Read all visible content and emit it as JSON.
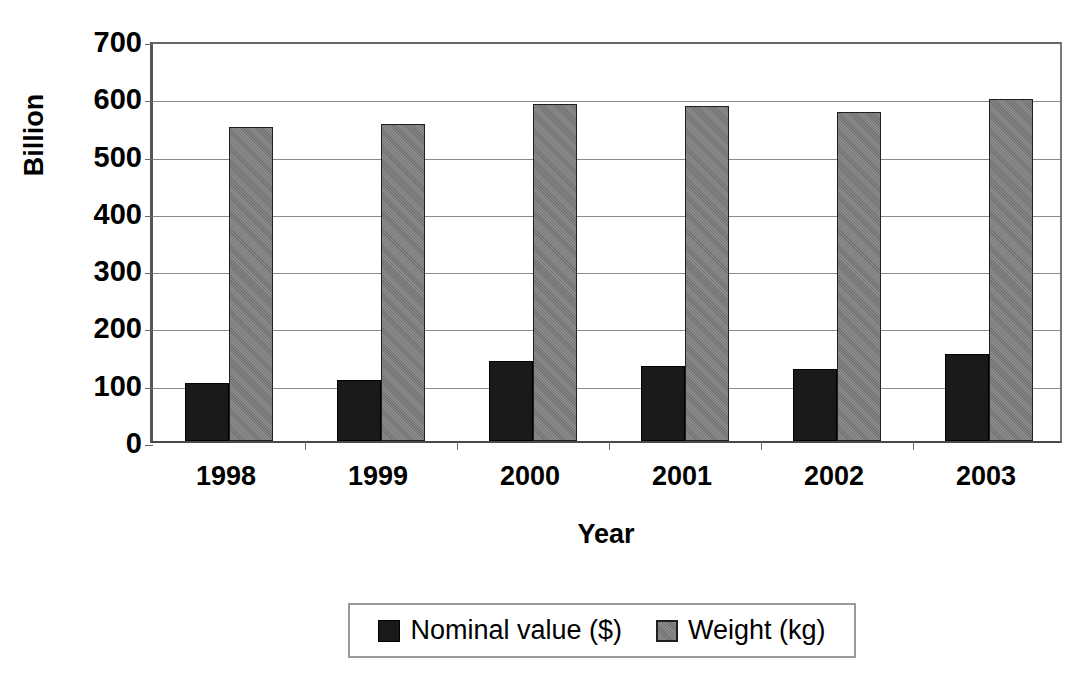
{
  "chart_data": {
    "type": "bar",
    "title": "",
    "subtitle": "",
    "xlabel": "Year",
    "ylabel": "Billion",
    "categories": [
      "1998",
      "1999",
      "2000",
      "2001",
      "2002",
      "2003"
    ],
    "series": [
      {
        "name": "Nominal value ($)",
        "color": "#1a1a1a",
        "values": [
          101,
          106,
          140,
          131,
          126,
          152
        ]
      },
      {
        "name": "Weight (kg)",
        "color": "#808080",
        "values": [
          548,
          553,
          588,
          585,
          575,
          597
        ]
      }
    ],
    "ylim": [
      0,
      700
    ],
    "ytick_labels": [
      "700",
      "600",
      "500",
      "400",
      "300",
      "200",
      "100",
      "0"
    ],
    "ytick_values": [
      700,
      600,
      500,
      400,
      300,
      200,
      100,
      0
    ],
    "ytick_step": 100,
    "grid": true,
    "grid_axis": "y",
    "legend_position": "bottom",
    "legend_orientation": "horizontal",
    "bar_mode": "grouped"
  },
  "axes": {
    "y_title": "Billion",
    "x_title": "Year"
  },
  "legend": {
    "entries": [
      {
        "label": "Nominal value ($)",
        "swatch": "black-square-icon"
      },
      {
        "label": "Weight (kg)",
        "swatch": "gray-square-icon"
      }
    ]
  }
}
